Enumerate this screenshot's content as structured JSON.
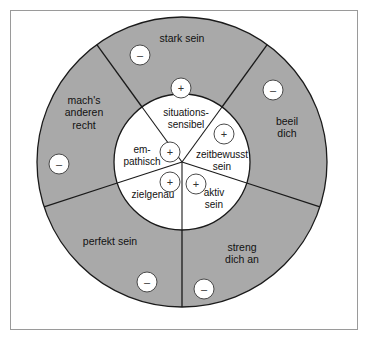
{
  "diagram": {
    "colors": {
      "outer_ring_fill": "#a9a9a9",
      "inner_circle_fill": "#ffffff",
      "stroke": "#1a1a1a",
      "frame_border": "#9a9a9a",
      "badge_fill": "#ffffff",
      "page_background": "#ffffff"
    },
    "geometry": {
      "center_x": 182,
      "center_y": 162,
      "outer_radius": 145,
      "inner_radius": 68,
      "sector_count": 5
    },
    "outer_ring": {
      "name": "antreiber-ring",
      "badge_symbol": "–",
      "sectors": [
        {
          "id": "stark-sein",
          "label": "stark sein",
          "label_x": 182,
          "label_y": 38,
          "badge_x": 140,
          "badge_y": 55
        },
        {
          "id": "beeil-dich",
          "label": "beeil\ndich",
          "label_x": 287,
          "label_y": 127,
          "badge_x": 273,
          "badge_y": 90
        },
        {
          "id": "streng-dich-an",
          "label": "streng\ndich an",
          "label_x": 242,
          "label_y": 253,
          "badge_x": 204,
          "badge_y": 289
        },
        {
          "id": "perfekt-sein",
          "label": "perfekt sein",
          "label_x": 110,
          "label_y": 241,
          "badge_x": 147,
          "badge_y": 282
        },
        {
          "id": "machs-anderen-recht",
          "label": "mach's\nanderen\nrecht",
          "label_x": 84,
          "label_y": 113,
          "badge_x": 59,
          "badge_y": 164
        }
      ]
    },
    "inner_circle": {
      "name": "erlauber-kreis",
      "badge_symbol": "+",
      "sectors": [
        {
          "id": "situationssensibel",
          "label": "situations-\nsensibel",
          "label_x": 186,
          "label_y": 119,
          "badge_x": 181,
          "badge_y": 88
        },
        {
          "id": "zeitbewusst-sein",
          "label": "zeitbewusst\nsein",
          "label_x": 222,
          "label_y": 161,
          "badge_x": 224,
          "badge_y": 134
        },
        {
          "id": "aktiv-sein",
          "label": "aktiv\nsein",
          "label_x": 214,
          "label_y": 199,
          "badge_x": 196,
          "badge_y": 184
        },
        {
          "id": "zielgenau",
          "label": "zielgenau",
          "label_x": 153,
          "label_y": 195,
          "badge_x": 170,
          "badge_y": 182
        },
        {
          "id": "empathisch",
          "label": "em-\npathisch",
          "label_x": 142,
          "label_y": 156,
          "badge_x": 170,
          "badge_y": 152
        }
      ]
    }
  }
}
